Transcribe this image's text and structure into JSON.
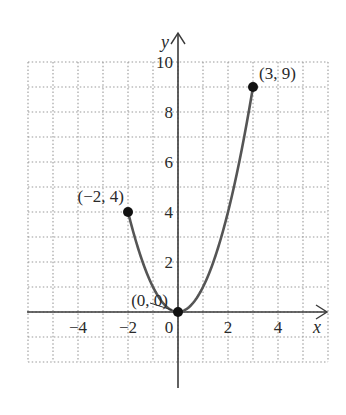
{
  "chart_data": {
    "type": "line",
    "title": "",
    "function": "y = x^2",
    "domain": [
      -2,
      3
    ],
    "xlabel": "x",
    "ylabel": "y",
    "xlim": [
      -6,
      6
    ],
    "ylim": [
      -2,
      10
    ],
    "grid": true,
    "grid_style": "dotted",
    "x_ticks": [
      -4,
      -2,
      0,
      2,
      4
    ],
    "x_tick_labels": [
      "−4",
      "−2",
      "0",
      "2",
      "4"
    ],
    "y_ticks": [
      2,
      4,
      6,
      8,
      10
    ],
    "y_tick_labels": [
      "2",
      "4",
      "6",
      "8",
      "10"
    ],
    "series": [
      {
        "name": "y = x^2, -2 ≤ x ≤ 3",
        "x": [
          -2,
          -1.5,
          -1,
          -0.5,
          0,
          0.5,
          1,
          1.5,
          2,
          2.5,
          3
        ],
        "y": [
          4,
          2.25,
          1,
          0.25,
          0,
          0.25,
          1,
          2.25,
          4,
          6.25,
          9
        ]
      }
    ],
    "points": [
      {
        "x": -2,
        "y": 4,
        "label": "(−2, 4)"
      },
      {
        "x": 0,
        "y": 0,
        "label": "(0, 0)"
      },
      {
        "x": 3,
        "y": 9,
        "label": "(3, 9)"
      }
    ],
    "colors": {
      "curve": "#555555",
      "axis": "#3a3a3a",
      "grid": "#9a9a9a",
      "point": "#111111"
    }
  }
}
